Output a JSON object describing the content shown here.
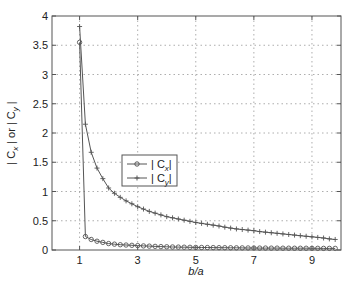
{
  "chart_data": {
    "type": "line",
    "title": "",
    "xlabel": "b/a",
    "ylabel": "| C_x | or | C_y |",
    "xlim": [
      0.05,
      10
    ],
    "ylim": [
      0,
      4
    ],
    "grid": true,
    "legend_position": "inside, center-left",
    "x_ticks": [
      1,
      3,
      5,
      7,
      9
    ],
    "y_ticks": [
      0,
      0.5,
      1,
      1.5,
      2,
      2.5,
      3,
      3.5,
      4
    ],
    "x_tick_labels": [
      "1",
      "3",
      "5",
      "7",
      "9"
    ],
    "y_tick_labels": [
      "0",
      "0.5",
      "1",
      "1.5",
      "2",
      "2.5",
      "3",
      "3.5",
      "4"
    ],
    "x": [
      1.0,
      1.2,
      1.4,
      1.6,
      1.8,
      2.0,
      2.2,
      2.4,
      2.6,
      2.8,
      3.0,
      3.2,
      3.4,
      3.6,
      3.8,
      4.0,
      4.2,
      4.4,
      4.6,
      4.8,
      5.0,
      5.2,
      5.4,
      5.6,
      5.8,
      6.0,
      6.2,
      6.4,
      6.6,
      6.8,
      7.0,
      7.2,
      7.4,
      7.6,
      7.8,
      8.0,
      8.2,
      8.4,
      8.6,
      8.8,
      9.0,
      9.2,
      9.4,
      9.6,
      9.8
    ],
    "series": [
      {
        "name": "| C_x |",
        "marker": "circle",
        "color": "#555555",
        "values": [
          3.55,
          0.23,
          0.18,
          0.15,
          0.13,
          0.11,
          0.1,
          0.09,
          0.085,
          0.08,
          0.075,
          0.07,
          0.066,
          0.062,
          0.058,
          0.055,
          0.052,
          0.05,
          0.048,
          0.046,
          0.044,
          0.043,
          0.042,
          0.041,
          0.04,
          0.039,
          0.038,
          0.037,
          0.036,
          0.035,
          0.034,
          0.033,
          0.033,
          0.032,
          0.032,
          0.031,
          0.031,
          0.03,
          0.03,
          0.03,
          0.029,
          0.029,
          0.028,
          0.028,
          0.028
        ]
      },
      {
        "name": "| C_y |",
        "marker": "plus",
        "color": "#555555",
        "values": [
          3.82,
          2.15,
          1.67,
          1.4,
          1.22,
          1.06,
          0.97,
          0.9,
          0.84,
          0.79,
          0.74,
          0.7,
          0.66,
          0.63,
          0.6,
          0.57,
          0.55,
          0.53,
          0.51,
          0.49,
          0.47,
          0.455,
          0.44,
          0.425,
          0.41,
          0.39,
          0.375,
          0.36,
          0.35,
          0.34,
          0.33,
          0.315,
          0.305,
          0.295,
          0.285,
          0.275,
          0.265,
          0.255,
          0.245,
          0.235,
          0.225,
          0.215,
          0.205,
          0.19,
          0.18
        ]
      }
    ]
  },
  "legend": {
    "items": [
      {
        "label": "| C",
        "sub": "x",
        "tail": "|"
      },
      {
        "label": "| C",
        "sub": "y",
        "tail": "|"
      }
    ]
  },
  "axes": {
    "xlabel": "b/a",
    "ylabel_parts": [
      "| C",
      "x",
      " | or | C",
      "y",
      " |"
    ]
  }
}
